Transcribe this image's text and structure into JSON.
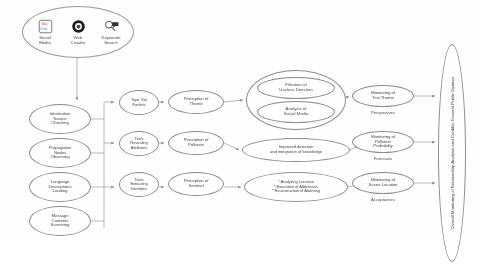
{
  "diagram": {
    "line_color": "#8d8d8d",
    "text_color": "#4a4a4a",
    "background": "#ffffff"
  },
  "source_cluster": {
    "items": [
      {
        "icon": "social-media-icon",
        "label_line1": "Social",
        "label_line2": "Media"
      },
      {
        "icon": "web-crawler-icon",
        "label_line1": "Web",
        "label_line2": "Crawler"
      },
      {
        "icon": "keywords-search-icon",
        "label_line1": "Keywords",
        "label_line2": "Search"
      }
    ]
  },
  "stage1": {
    "nodes": [
      {
        "line1": "Information",
        "line2": "Source",
        "line3": "Checking"
      },
      {
        "line1": "Propagation",
        "line2": "Nodes",
        "line3": "Observing"
      },
      {
        "line1": "Language",
        "line2": "Descriptions",
        "line3": "Loading"
      },
      {
        "line1": "Message",
        "line2": "Contents",
        "line3": "Screening"
      }
    ]
  },
  "stage2": {
    "nodes": [
      {
        "line1": "Topic Set",
        "line2": "Forfeits"
      },
      {
        "line1": "Texts",
        "line2": "Revealing",
        "line3": "Attributes"
      },
      {
        "line1": "Texts",
        "line2": "Extracting",
        "line3": "Identities"
      }
    ]
  },
  "stage3": {
    "nodes": [
      {
        "line1": "Perception of",
        "line2": "Theme"
      },
      {
        "line1": "Perception of",
        "line2": "Pollution"
      },
      {
        "line1": "Perception of",
        "line2": "Sentinel"
      }
    ]
  },
  "stage4": {
    "group1": {
      "sub1": {
        "line1": "Filtration of",
        "line2": "Useless Direction"
      },
      "sub2": {
        "line1": "Analysis of",
        "line2": "Social Media"
      }
    },
    "group2": {
      "line1": "Improved detection",
      "line2": "and integration of knowledge"
    },
    "group3": {
      "line1": "* Analyzing Location",
      "line2": "* Execution of Addresses",
      "line3": "* Re-instruction of Alarming"
    }
  },
  "stage5": {
    "nodes": [
      {
        "line1": "Monitoring of",
        "line2": "Text Theme",
        "caption": "Perspectives"
      },
      {
        "line1": "Monitoring of",
        "line2": "Pollution",
        "line3": "Probability",
        "caption": "Forecasts"
      },
      {
        "line1": "Monitoring of",
        "line2": "Scene Location",
        "caption": "Acceptances"
      }
    ]
  },
  "final": {
    "label": "Overall Monitoring of Relationship Analysis and Credible General Public Opinion"
  }
}
